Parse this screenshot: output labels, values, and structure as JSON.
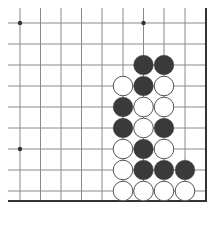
{
  "board": {
    "description": "Go board corner diagram (bottom-right corner)",
    "colors": {
      "line": "#8a8a8a",
      "edge": "#333333",
      "black": "#3a3a3a",
      "white": "#ffffff",
      "white_stroke": "#555555",
      "hoshi": "#333333"
    },
    "x_lines": [
      20,
      40.5,
      61,
      81.5,
      102,
      123,
      143.5,
      164,
      185
    ],
    "y_lines": [
      23,
      44,
      65,
      86,
      107,
      128,
      149,
      170,
      191
    ],
    "right_edge_x": 206,
    "bottom_edge_y": 201,
    "hoshi": [
      {
        "col": 0,
        "row": 0
      },
      {
        "col": 6,
        "row": 0
      },
      {
        "col": 0,
        "row": 6
      }
    ],
    "stones": [
      {
        "col": 6,
        "row": 2,
        "color": "black"
      },
      {
        "col": 7,
        "row": 2,
        "color": "black"
      },
      {
        "col": 5,
        "row": 3,
        "color": "white"
      },
      {
        "col": 6,
        "row": 3,
        "color": "black"
      },
      {
        "col": 7,
        "row": 3,
        "color": "white"
      },
      {
        "col": 5,
        "row": 4,
        "color": "black"
      },
      {
        "col": 6,
        "row": 4,
        "color": "white"
      },
      {
        "col": 7,
        "row": 4,
        "color": "white"
      },
      {
        "col": 5,
        "row": 5,
        "color": "black"
      },
      {
        "col": 6,
        "row": 5,
        "color": "white"
      },
      {
        "col": 7,
        "row": 5,
        "color": "black"
      },
      {
        "col": 5,
        "row": 6,
        "color": "white"
      },
      {
        "col": 6,
        "row": 6,
        "color": "black"
      },
      {
        "col": 7,
        "row": 6,
        "color": "white"
      },
      {
        "col": 5,
        "row": 7,
        "color": "white"
      },
      {
        "col": 6,
        "row": 7,
        "color": "black"
      },
      {
        "col": 7,
        "row": 7,
        "color": "black"
      },
      {
        "col": 8,
        "row": 7,
        "color": "black"
      },
      {
        "col": 5,
        "row": 8,
        "color": "white"
      },
      {
        "col": 6,
        "row": 8,
        "color": "white"
      },
      {
        "col": 7,
        "row": 8,
        "color": "white"
      },
      {
        "col": 8,
        "row": 8,
        "color": "white"
      }
    ]
  }
}
